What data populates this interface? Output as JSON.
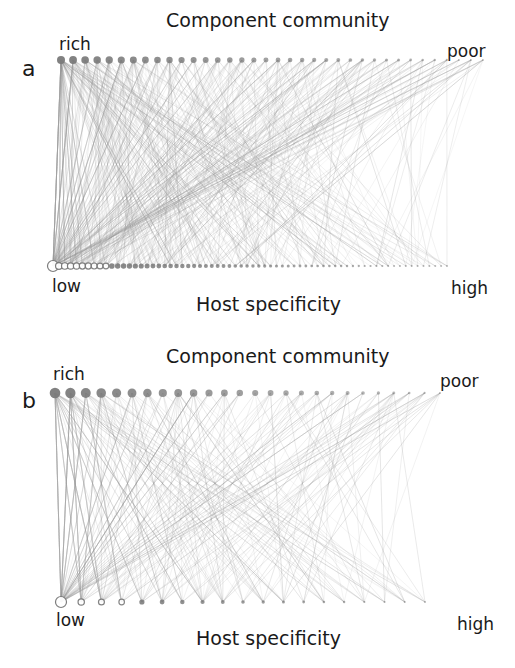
{
  "panels": [
    {
      "id": "a",
      "letter": "a",
      "top_title": "Component community",
      "top_left": "rich",
      "top_right": "poor",
      "bottom_left": "low",
      "bottom_right": "high",
      "bottom_title": "Host specificity",
      "top_nodes": 36,
      "bottom_nodes": 68,
      "edge_count": 520,
      "seed": 7
    },
    {
      "id": "b",
      "letter": "b",
      "top_title": "Component community",
      "top_left": "rich",
      "top_right": "poor",
      "bottom_left": "low",
      "bottom_right": "high",
      "bottom_title": "Host specificity",
      "top_nodes": 26,
      "bottom_nodes": 19,
      "edge_count": 300,
      "seed": 13
    }
  ],
  "colors": {
    "edge": "#9a9a9a",
    "top_node": "#7a7a7a",
    "bottom_node_stroke": "#777777",
    "text": "#1a1a1a"
  }
}
